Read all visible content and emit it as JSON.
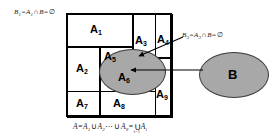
{
  "diagram": {
    "colors": {
      "ellipse_fill": "#a8a8a8",
      "ellipse_stroke": "#3a3a3a",
      "line": "#000000",
      "background": "#ffffff"
    },
    "partition": {
      "cells": [
        {
          "name": "A1",
          "label": "A",
          "sub": "1"
        },
        {
          "name": "A2",
          "label": "A",
          "sub": "2"
        },
        {
          "name": "A3",
          "label": "A",
          "sub": "3"
        },
        {
          "name": "A4",
          "label": "A",
          "sub": "4"
        },
        {
          "name": "A5",
          "label": "A",
          "sub": "5"
        },
        {
          "name": "A6",
          "label": "A",
          "sub": "6"
        },
        {
          "name": "A7",
          "label": "A",
          "sub": "7"
        },
        {
          "name": "A8",
          "label": "A",
          "sub": "8"
        },
        {
          "name": "A9",
          "label": "A",
          "sub": "9"
        }
      ]
    },
    "set_b": {
      "label": "B"
    },
    "annotations": {
      "left": {
        "b_label": "B",
        "b_sub": "1",
        "eq1": "=",
        "a_label": "A",
        "a_sub": "1",
        "cap": "∩",
        "b2": "B",
        "eq2": "=",
        "empty": "∅"
      },
      "right": {
        "b_label": "B",
        "b_sub": "3",
        "eq1": "=",
        "a_label": "A",
        "a_sub": "3",
        "cap": "∩",
        "b2": "B",
        "eq2": "=",
        "empty": "∅"
      },
      "bottom": {
        "a": "A",
        "eq1": "=",
        "a1": "A",
        "a1_sub": "1",
        "cup1": "∪",
        "a2": "A",
        "a2_sub": "2",
        "dots": "⋯",
        "cup2": "∪",
        "a9": "A",
        "a9_sub": "9",
        "eq2": "=",
        "bigcup": "∪",
        "bigcup_upper": "9",
        "bigcup_lower": "i=1",
        "ai": "A",
        "ai_sub": "i"
      }
    },
    "arrows": [
      {
        "name": "arrow-to-a3-region",
        "from": "B3 label",
        "to": "A3 gray overlap"
      },
      {
        "name": "arrow-to-a6-region",
        "from": "B ellipse",
        "to": "A6 gray overlap"
      }
    ]
  }
}
